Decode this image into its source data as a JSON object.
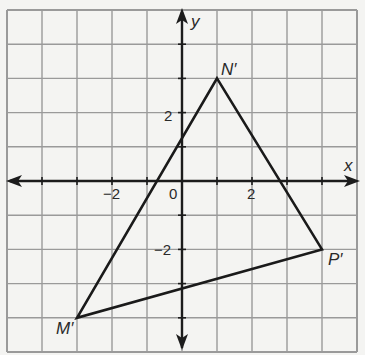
{
  "figure": {
    "type": "coordinate-plane",
    "grid": {
      "x_min": -5,
      "x_max": 5,
      "y_min": -5,
      "y_max": 5,
      "step": 1
    },
    "axes": {
      "x_label": "x",
      "y_label": "y",
      "origin_label": "0",
      "x_ticks": [
        {
          "value": -2,
          "label": "−2"
        },
        {
          "value": 2,
          "label": "2"
        }
      ],
      "y_ticks": [
        {
          "value": 2,
          "label": "2"
        },
        {
          "value": -2,
          "label": "−2"
        }
      ]
    },
    "triangle": {
      "vertices": [
        {
          "name": "N′",
          "x": 1,
          "y": 3
        },
        {
          "name": "P′",
          "x": 4,
          "y": -2
        },
        {
          "name": "M′",
          "x": -3,
          "y": -4
        }
      ]
    },
    "colors": {
      "grid": "#9a9a9a",
      "axis": "#1c1c1c",
      "shape": "#1a1a1a",
      "background": "#f4f4f2"
    }
  }
}
